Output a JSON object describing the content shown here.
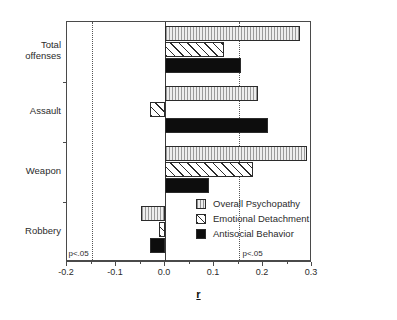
{
  "chart_data": {
    "type": "bar",
    "orientation": "horizontal",
    "title": "",
    "xlabel": "r",
    "ylabel": "",
    "xlim": [
      -0.2,
      0.3
    ],
    "grid": false,
    "legend_position": "inside-right",
    "categories": [
      "Total\noffenses",
      "Assault",
      "Weapon",
      "Robbery"
    ],
    "x_tick_labels": [
      "-0.2",
      "-0.1",
      "0.0",
      "0.1",
      "0.2",
      "0.3"
    ],
    "x_tick_values": [
      -0.2,
      -0.1,
      0.0,
      0.1,
      0.2,
      0.3
    ],
    "x_minor_tick_values": [
      -0.15,
      -0.05,
      0.05,
      0.15,
      0.25
    ],
    "series": [
      {
        "name": "Overall Psychopathy",
        "fill": "light-vertical-hatch",
        "values": [
          0.275,
          0.19,
          0.29,
          -0.05
        ]
      },
      {
        "name": "Emotional Detachment",
        "fill": "diagonal-hatch",
        "values": [
          0.12,
          -0.03,
          0.18,
          -0.012
        ]
      },
      {
        "name": "Antisocial Behavior",
        "fill": "solid-black",
        "values": [
          0.155,
          0.21,
          0.09,
          -0.03
        ]
      }
    ],
    "annotations": [
      {
        "label": "p<.05",
        "value": -0.15,
        "side": "left"
      },
      {
        "label": "p<.05",
        "value": 0.15,
        "side": "right"
      }
    ],
    "significance_lines": [
      -0.15,
      0.15
    ],
    "zero_line": 0.0,
    "colors": {
      "axis": "#4a4a4a",
      "bar_outline": "#2b2b2b",
      "series_overall": "#e2e2e2",
      "series_emotional": "#ffffff",
      "series_antisocial": "#0d0d0d",
      "significance_line": "#555555",
      "text": "#2b2b2b"
    }
  }
}
